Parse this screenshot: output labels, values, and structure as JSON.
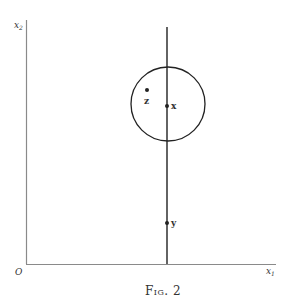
{
  "figure": {
    "caption": "Fig. 2",
    "axes": {
      "x_axis_label": "x",
      "x_axis_subscript": "1",
      "y_axis_label": "x",
      "y_axis_subscript": "2",
      "origin_label": "O"
    },
    "points": [
      {
        "id": "z",
        "label": "z"
      },
      {
        "id": "x",
        "label": "x"
      },
      {
        "id": "y",
        "label": "y"
      }
    ],
    "colors": {
      "ink": "#222222",
      "axis": "#888888",
      "background": "#ffffff"
    }
  }
}
